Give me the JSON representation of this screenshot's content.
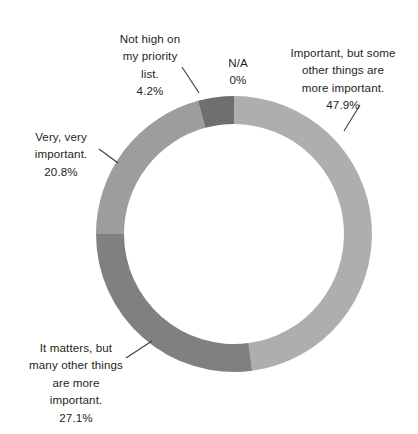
{
  "chart_data": {
    "type": "pie",
    "variant": "donut",
    "title": "",
    "subtitle": "",
    "xlabel": "",
    "ylabel": "",
    "legend_position": "none",
    "grid": false,
    "units": "percent",
    "total": 100,
    "center": {
      "x": 234,
      "y": 234
    },
    "outer_radius": 138,
    "inner_radius": 110,
    "start_angle_deg": 0,
    "direction": "clockwise",
    "categories": [
      "Important, but some other things are more important.",
      "It matters, but many other things are more important.",
      "Very, very important.",
      "Not high on my priority list.",
      "N/A"
    ],
    "values": [
      47.9,
      27.1,
      20.8,
      4.2,
      0
    ],
    "colors": [
      "#aeaeae",
      "#808080",
      "#9d9d9d",
      "#6f6f6f",
      "#ffffff"
    ],
    "slices": [
      {
        "label": "Important, but some other things are more important.",
        "value": 47.9,
        "value_text": "47.9%",
        "color": "#aeaeae",
        "start_deg": 0,
        "end_deg": 172.44
      },
      {
        "label": "It matters, but many other things are more important.",
        "value": 27.1,
        "value_text": "27.1%",
        "color": "#808080",
        "start_deg": 172.44,
        "end_deg": 270.0
      },
      {
        "label": "Very, very important.",
        "value": 20.8,
        "value_text": "20.8%",
        "color": "#9d9d9d",
        "start_deg": 270.0,
        "end_deg": 344.88
      },
      {
        "label": "Not high on my priority list.",
        "value": 4.2,
        "value_text": "4.2%",
        "color": "#6f6f6f",
        "start_deg": 344.88,
        "end_deg": 360.0
      },
      {
        "label": "N/A",
        "value": 0,
        "value_text": "0%",
        "color": "#ffffff",
        "start_deg": 360.0,
        "end_deg": 360.0
      }
    ]
  },
  "labels": {
    "not_high": {
      "text": "Not high on\nmy priority\nlist.",
      "percent": "4.2%"
    },
    "na": {
      "text": "N/A",
      "percent": "0%"
    },
    "important_but": {
      "text": "Important, but some\nother things are\nmore important.",
      "percent": "47.9%"
    },
    "very_very": {
      "text": "Very, very\nimportant.",
      "percent": "20.8%"
    },
    "it_matters": {
      "text": "It matters, but\nmany other things\nare more\nimportant.",
      "percent": "27.1%"
    }
  },
  "leader_lines": [
    {
      "name": "not-high",
      "x1": 182,
      "y1": 67,
      "x2": 199,
      "y2": 93
    },
    {
      "name": "important-but",
      "x1": 360,
      "y1": 105,
      "x2": 344,
      "y2": 131
    },
    {
      "name": "very-very",
      "x1": 99,
      "y1": 149,
      "x2": 118,
      "y2": 163
    },
    {
      "name": "it-matters",
      "x1": 126,
      "y1": 358,
      "x2": 152,
      "y2": 341
    }
  ]
}
